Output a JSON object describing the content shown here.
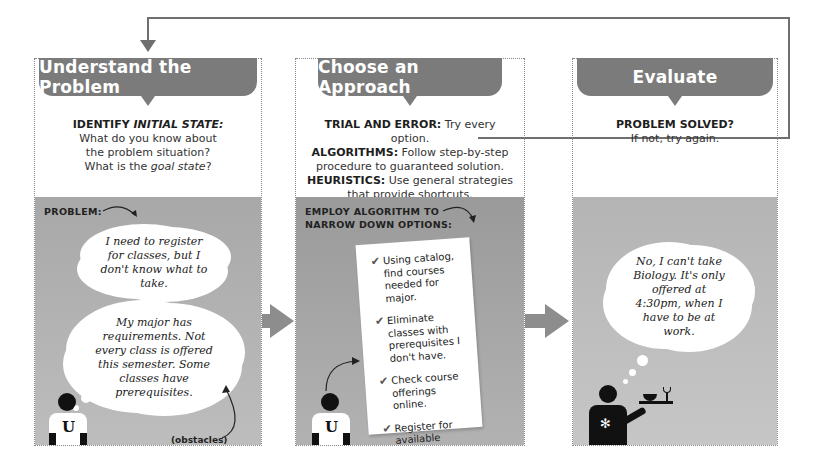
{
  "colors": {
    "banner": "#7b7b7b",
    "scene_bg": "#b0b0b0",
    "arrow": "#8d8d8d",
    "loop_line": "#6f6f6f"
  },
  "steps": [
    {
      "title": "Understand the Problem",
      "desc": {
        "heading_prefix": "IDENTIFY ",
        "heading_em": "INITIAL STATE:",
        "line1": "What do you know about",
        "line2": "the problem situation?",
        "line3_prefix": "What is the ",
        "line3_em": "goal state",
        "line3_suffix": "?"
      },
      "scene": {
        "label": "PROBLEM:",
        "thought1": "I need to register for classes, but I don't know what to take.",
        "thought2": "My major has requirements. Not every class is offered this semester. Some classes have prerequisites.",
        "annotation": "(obstacles)",
        "figure_icon": "student-u-icon",
        "shirt_letter": "U"
      }
    },
    {
      "title": "Choose an Approach",
      "desc": {
        "items": [
          {
            "term": "TRIAL AND ERROR:",
            "text": " Try every option."
          },
          {
            "term": "ALGORITHMS:",
            "text": " Follow step-by-step procedure to guaranteed solution."
          },
          {
            "term": "HEURISTICS:",
            "text": " Use general strategies that provide shortcuts."
          }
        ]
      },
      "scene": {
        "label_line1": "EMPLOY ALGORITHM TO",
        "label_line2": "NARROW DOWN OPTIONS:",
        "checklist": [
          "Using catalog, find courses needed for major.",
          "Eliminate classes with prerequisites I don't have.",
          "Check course offerings online.",
          "Register for available classes."
        ],
        "check_icon": "✔",
        "figure_icon": "student-u-icon",
        "shirt_letter": "U"
      }
    },
    {
      "title": "Evaluate",
      "desc": {
        "heading": "PROBLEM SOLVED?",
        "line1": "If not, try again."
      },
      "scene": {
        "thought": "No, I can't take Biology. It's only offered at 4:30pm, when I have to be at work.",
        "figure_icon": "waiter-icon"
      }
    }
  ]
}
